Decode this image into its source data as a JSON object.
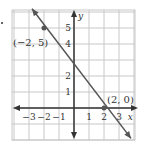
{
  "chart_data": {
    "type": "line",
    "title": "",
    "xlabel": "x",
    "ylabel": "y",
    "xlim": [
      -4,
      4
    ],
    "ylim": [
      -2,
      6
    ],
    "grid": true,
    "x_ticks": [
      -3,
      -2,
      -1,
      1,
      2,
      3
    ],
    "x_tick_labels": [
      "−3",
      "−2",
      "−1",
      "1",
      "2",
      "3"
    ],
    "y_ticks": [
      1,
      2,
      4,
      5
    ],
    "y_tick_labels": [
      "1",
      "2",
      "4",
      "5"
    ],
    "series": [
      {
        "name": "line",
        "x": [
          -2.8,
          3.8
        ],
        "y": [
          6.2,
          -1.9
        ],
        "color": "#555555"
      }
    ],
    "points": [
      {
        "x": -2,
        "y": 5,
        "label": "(−2, 5)"
      },
      {
        "x": 2,
        "y": 0,
        "label": "(2, 0)"
      }
    ]
  },
  "colors": {
    "grid": "#c8c8c8",
    "axis": "#333333",
    "line": "#555555",
    "text": "#333333"
  }
}
